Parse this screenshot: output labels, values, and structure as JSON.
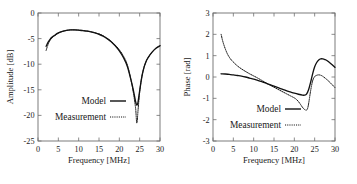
{
  "figure": {
    "panels": [
      "amplitude",
      "phase"
    ],
    "line_color": "#111111",
    "axis_color": "#6e6e6e",
    "background": "#ffffff"
  },
  "chart_data": [
    {
      "type": "line",
      "title": "",
      "xlabel": "Frequency [MHz]",
      "ylabel": "Amplitude [dB]",
      "xlim": [
        0,
        30
      ],
      "ylim": [
        -25,
        0
      ],
      "xticks": [
        0,
        5,
        10,
        15,
        20,
        25,
        30
      ],
      "yticks": [
        0,
        -5,
        -10,
        -15,
        -20,
        -25
      ],
      "xticklabels": [
        "0",
        "5",
        "10",
        "15",
        "20",
        "25",
        "30"
      ],
      "yticklabels": [
        "0",
        "-5",
        "-10",
        "-15",
        "-20",
        "-25"
      ],
      "grid": false,
      "legend_position": "center",
      "series": [
        {
          "name": "Model",
          "style": "solid",
          "x": [
            2.0,
            2.5,
            3.0,
            3.5,
            4.0,
            5.0,
            6.0,
            7.0,
            8.0,
            9.0,
            10.0,
            11.0,
            12.0,
            13.0,
            14.0,
            15.0,
            16.0,
            17.0,
            18.0,
            19.0,
            20.0,
            21.0,
            22.0,
            23.0,
            23.5,
            24.0,
            24.3,
            24.6,
            25.0,
            25.5,
            26.0,
            26.5,
            27.0,
            28.0,
            29.0,
            30.0
          ],
          "values": [
            -6.5,
            -5.7,
            -5.1,
            -4.7,
            -4.4,
            -3.9,
            -3.6,
            -3.4,
            -3.3,
            -3.3,
            -3.35,
            -3.45,
            -3.55,
            -3.7,
            -3.9,
            -4.15,
            -4.5,
            -5.0,
            -5.6,
            -6.4,
            -7.4,
            -8.7,
            -10.5,
            -13.5,
            -15.3,
            -17.3,
            -18.0,
            -17.4,
            -15.2,
            -12.6,
            -10.8,
            -9.6,
            -8.8,
            -7.7,
            -6.9,
            -6.4
          ]
        },
        {
          "name": "Measurement",
          "style": "dotted",
          "x": [
            2.0,
            2.5,
            3.0,
            3.5,
            4.0,
            5.0,
            6.0,
            7.0,
            8.0,
            9.0,
            10.0,
            11.0,
            12.0,
            13.0,
            14.0,
            15.0,
            16.0,
            17.0,
            18.0,
            19.0,
            20.0,
            21.0,
            22.0,
            23.0,
            23.5,
            24.0,
            24.3,
            24.6,
            25.0,
            25.5,
            26.0,
            26.5,
            27.0,
            28.0,
            29.0,
            30.0
          ],
          "values": [
            -7.3,
            -6.1,
            -5.3,
            -4.8,
            -4.5,
            -3.95,
            -3.6,
            -3.4,
            -3.3,
            -3.3,
            -3.35,
            -3.4,
            -3.5,
            -3.65,
            -3.85,
            -4.1,
            -4.45,
            -4.95,
            -5.55,
            -6.3,
            -7.2,
            -8.4,
            -10.2,
            -13.6,
            -15.8,
            -18.6,
            -21.5,
            -19.0,
            -15.4,
            -12.6,
            -10.8,
            -9.6,
            -8.8,
            -7.7,
            -6.9,
            -6.4
          ]
        }
      ]
    },
    {
      "type": "line",
      "title": "",
      "xlabel": "Frequency [MHz]",
      "ylabel": "Phase [rad]",
      "xlim": [
        0,
        30
      ],
      "ylim": [
        -3,
        3
      ],
      "xticks": [
        0,
        5,
        10,
        15,
        20,
        25,
        30
      ],
      "yticks": [
        3,
        2,
        1,
        0,
        -1,
        -2,
        -3
      ],
      "xticklabels": [
        "0",
        "5",
        "10",
        "15",
        "20",
        "25",
        "30"
      ],
      "yticklabels": [
        "3",
        "2",
        "1",
        "0",
        "-1",
        "-2",
        "-3"
      ],
      "grid": false,
      "legend_position": "center",
      "series": [
        {
          "name": "Model",
          "style": "solid",
          "x": [
            2.0,
            3.0,
            4.0,
            5.0,
            6.0,
            7.0,
            8.0,
            9.0,
            10.0,
            11.0,
            12.0,
            13.0,
            14.0,
            15.0,
            16.0,
            17.0,
            18.0,
            19.0,
            20.0,
            21.0,
            22.0,
            22.5,
            23.0,
            23.5,
            24.0,
            24.5,
            25.0,
            25.5,
            26.0,
            26.5,
            27.0,
            27.5,
            28.0,
            29.0,
            30.0
          ],
          "values": [
            0.15,
            0.14,
            0.12,
            0.1,
            0.07,
            0.04,
            0.0,
            -0.05,
            -0.1,
            -0.16,
            -0.22,
            -0.29,
            -0.36,
            -0.43,
            -0.5,
            -0.57,
            -0.64,
            -0.7,
            -0.76,
            -0.81,
            -0.85,
            -0.85,
            -0.8,
            -0.6,
            -0.25,
            0.15,
            0.48,
            0.68,
            0.8,
            0.85,
            0.85,
            0.82,
            0.77,
            0.62,
            0.45
          ]
        },
        {
          "name": "Measurement",
          "style": "dotted",
          "x": [
            2.0,
            2.3,
            2.6,
            3.0,
            3.5,
            4.0,
            4.5,
            5.0,
            6.0,
            7.0,
            8.0,
            9.0,
            10.0,
            11.0,
            12.0,
            13.0,
            14.0,
            15.0,
            16.0,
            17.0,
            18.0,
            19.0,
            20.0,
            20.5,
            21.0,
            21.5,
            22.0,
            22.5,
            23.0,
            23.3,
            23.6,
            24.0,
            24.5,
            25.0,
            25.5,
            26.0,
            26.5,
            27.0,
            28.0,
            29.0,
            30.0
          ],
          "values": [
            2.0,
            1.75,
            1.55,
            1.33,
            1.1,
            0.93,
            0.8,
            0.7,
            0.52,
            0.38,
            0.26,
            0.15,
            0.05,
            -0.05,
            -0.16,
            -0.27,
            -0.38,
            -0.48,
            -0.58,
            -0.68,
            -0.78,
            -0.88,
            -0.98,
            -1.05,
            -1.15,
            -1.28,
            -1.42,
            -1.52,
            -1.55,
            -1.45,
            -1.15,
            -0.65,
            -0.18,
            0.02,
            0.08,
            0.1,
            0.08,
            0.03,
            -0.12,
            -0.3,
            -0.5
          ]
        }
      ]
    }
  ],
  "legend": {
    "model_label": "Model",
    "measurement_label": "Measurement"
  }
}
